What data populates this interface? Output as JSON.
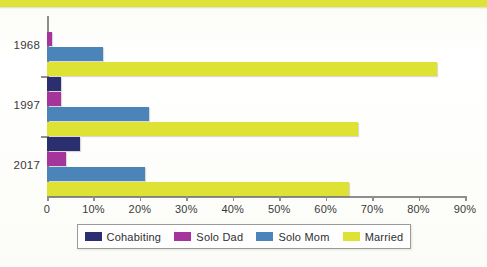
{
  "chart_data": {
    "type": "bar",
    "orientation": "horizontal",
    "title": "",
    "xlabel": "",
    "ylabel": "",
    "categories": [
      "1968",
      "1997",
      "2017"
    ],
    "xlim": [
      0,
      90
    ],
    "xticks": [
      0,
      10,
      20,
      30,
      40,
      50,
      60,
      70,
      80,
      90
    ],
    "xtick_labels": [
      "0",
      "10%",
      "20%",
      "30%",
      "40%",
      "50%",
      "60%",
      "70%",
      "80%",
      "90%"
    ],
    "grid": false,
    "legend_position": "bottom",
    "series": [
      {
        "name": "Cohabiting",
        "color": "#2b2f70",
        "values": [
          0,
          3,
          7
        ]
      },
      {
        "name": "Solo Dad",
        "color": "#a5349b",
        "values": [
          1,
          3,
          4
        ]
      },
      {
        "name": "Solo Mom",
        "color": "#4a84b8",
        "values": [
          12,
          22,
          21
        ]
      },
      {
        "name": "Married",
        "color": "#dde234",
        "values": [
          84,
          67,
          65
        ]
      }
    ]
  },
  "legend": {
    "items": [
      {
        "label": "Cohabiting",
        "color": "#2b2f70"
      },
      {
        "label": "Solo Dad",
        "color": "#a5349b"
      },
      {
        "label": "Solo Mom",
        "color": "#4a84b8"
      },
      {
        "label": "Married",
        "color": "#dde234"
      }
    ]
  },
  "axis": {
    "y_labels": [
      "1968",
      "1997",
      "2017"
    ],
    "x_labels": [
      "0",
      "10%",
      "20%",
      "30%",
      "40%",
      "50%",
      "60%",
      "70%",
      "80%",
      "90%"
    ]
  },
  "colors": {
    "cohabiting": "#2b2f70",
    "solo_dad": "#a5349b",
    "solo_mom": "#4a84b8",
    "married": "#dde234",
    "axis": "#8e8e8e",
    "background": "#fdfdfb",
    "top_band": "#dfe337"
  }
}
